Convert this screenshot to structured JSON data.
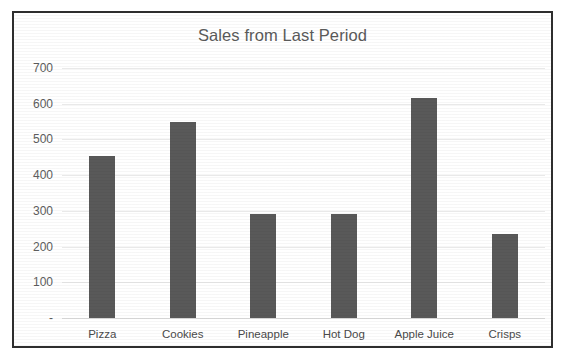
{
  "chart_data": {
    "type": "bar",
    "title": "Sales from Last Period",
    "xlabel": "",
    "ylabel": "",
    "categories": [
      "Pizza",
      "Cookies",
      "Pineapple",
      "Hot Dog",
      "Apple Juice",
      "Crisps"
    ],
    "values": [
      455,
      550,
      290,
      292,
      617,
      235
    ],
    "ylim": [
      0,
      700
    ],
    "ytick_values": [
      0,
      100,
      200,
      300,
      400,
      500,
      600,
      700
    ],
    "ytick_labels": [
      "-",
      "100",
      "200",
      "300",
      "400",
      "500",
      "600",
      "700"
    ],
    "grid": true,
    "legend": false,
    "series": [
      {
        "name": "Sales",
        "values": [
          455,
          550,
          290,
          292,
          617,
          235
        ]
      }
    ],
    "colors": {
      "bar": "#595959",
      "gridline": "#e9e9e9",
      "title_text": "#5a5a5a",
      "tick_text": "#5d5d5d",
      "border": "#2e2e2e",
      "background": "#ffffff"
    }
  }
}
